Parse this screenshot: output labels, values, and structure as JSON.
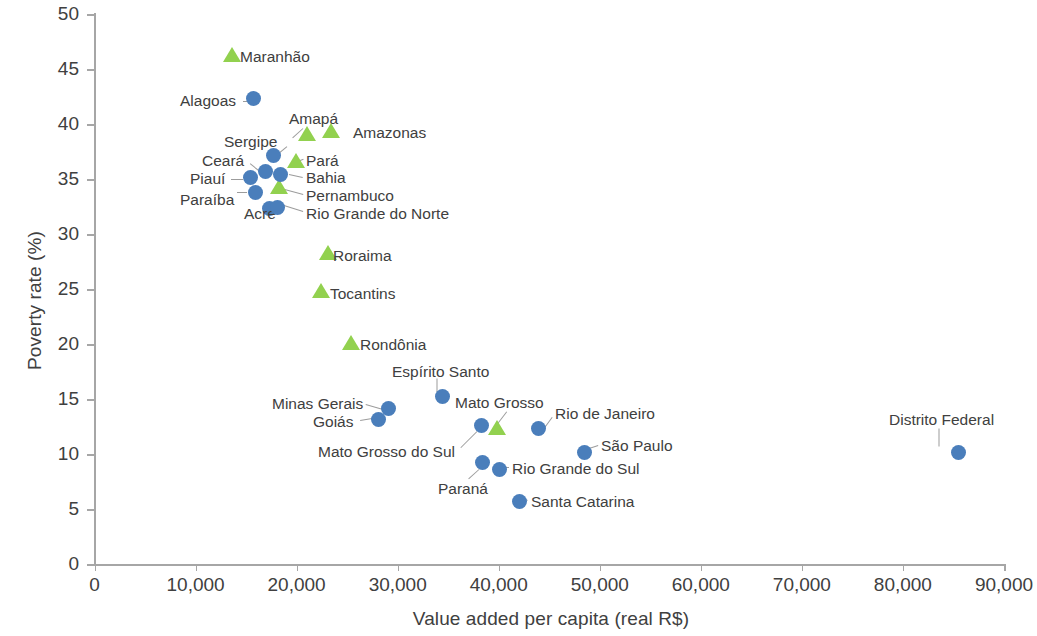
{
  "chart_data": {
    "type": "scatter",
    "title": "",
    "xlabel": "Value added per capita (real R$)",
    "ylabel": "Poverty rate (%)",
    "xlim": [
      0,
      90000
    ],
    "ylim": [
      0,
      50
    ],
    "xticks": [
      "0",
      "10,000",
      "20,000",
      "30,000",
      "40,000",
      "50,000",
      "60,000",
      "70,000",
      "80,000",
      "90,000"
    ],
    "xtick_values": [
      0,
      10000,
      20000,
      30000,
      40000,
      50000,
      60000,
      70000,
      80000,
      90000
    ],
    "yticks": [
      "0",
      "5",
      "10",
      "15",
      "20",
      "25",
      "30",
      "35",
      "40",
      "45",
      "50"
    ],
    "ytick_values": [
      0,
      5,
      10,
      15,
      20,
      25,
      30,
      35,
      40,
      45,
      50
    ],
    "grid": false,
    "legend": "none",
    "series": [
      {
        "name": "North/Northeast states",
        "marker": "triangle",
        "color": "#92d14f",
        "points": [
          {
            "label": "Maranhão",
            "x": 13600,
            "y": 46.3,
            "label_x": 240,
            "label_y": 48,
            "leader": null
          },
          {
            "label": "Amapá",
            "x": 21000,
            "y": 39.1,
            "label_x": 289,
            "label_y": 110,
            "leader": {
              "x1": 303,
              "y1": 128,
              "x2": 293,
              "y2": 137
            }
          },
          {
            "label": "Amazonas",
            "x": 23400,
            "y": 39.4,
            "label_x": 353,
            "label_y": 124,
            "leader": null
          },
          {
            "label": "Pará",
            "x": 19900,
            "y": 36.6,
            "label_x": 306,
            "label_y": 152,
            "leader": {
              "x1": 295,
              "y1": 162,
              "x2": 303,
              "y2": 159
            }
          },
          {
            "label": "Pernambuco",
            "x": 18300,
            "y": 34.3,
            "label_x": 306,
            "label_y": 187,
            "leader": {
              "x1": 281,
              "y1": 188,
              "x2": 303,
              "y2": 194
            }
          },
          {
            "label": "Roraima",
            "x": 23100,
            "y": 28.3,
            "label_x": 333,
            "label_y": 247,
            "leader": null
          },
          {
            "label": "Tocantins",
            "x": 22400,
            "y": 24.8,
            "label_x": 330,
            "label_y": 285,
            "leader": null
          },
          {
            "label": "Rondônia",
            "x": 25400,
            "y": 20.1,
            "label_x": 360,
            "label_y": 336,
            "leader": null
          },
          {
            "label": "Mato Grosso",
            "x": 39800,
            "y": 12.4,
            "label_x": 455,
            "label_y": 394,
            "leader": {
              "x1": 497,
              "y1": 424,
              "x2": 507,
              "y2": 411
            }
          }
        ]
      },
      {
        "name": "Other states",
        "marker": "circle",
        "color": "#4a7ebb",
        "points": [
          {
            "label": "Alagoas",
            "x": 15700,
            "y": 42.3,
            "label_x": 180,
            "label_y": 92,
            "leader": {
              "x1": 247,
              "y1": 101,
              "x2": 243,
              "y2": 101
            }
          },
          {
            "label": "Sergipe",
            "x": 17700,
            "y": 37.1,
            "label_x": 224,
            "label_y": 133,
            "leader": {
              "x1": 270,
              "y1": 160,
              "x2": 287,
              "y2": 146
            }
          },
          {
            "label": "Ceará",
            "x": 16900,
            "y": 35.7,
            "label_x": 202,
            "label_y": 152,
            "leader": {
              "x1": 261,
              "y1": 172,
              "x2": 250,
              "y2": 163
            }
          },
          {
            "label": "Piauí",
            "x": 15400,
            "y": 35.1,
            "label_x": 190,
            "label_y": 170,
            "leader": {
              "x1": 243,
              "y1": 179,
              "x2": 231,
              "y2": 179
            }
          },
          {
            "label": "Paraíba",
            "x": 15900,
            "y": 33.8,
            "label_x": 180,
            "label_y": 191,
            "leader": {
              "x1": 247,
              "y1": 192,
              "x2": 237,
              "y2": 192
            }
          },
          {
            "label": "Bahia",
            "x": 18400,
            "y": 35.4,
            "label_x": 306,
            "label_y": 169,
            "leader": {
              "x1": 289,
              "y1": 174,
              "x2": 303,
              "y2": 177
            }
          },
          {
            "label": "Acre",
            "x": 17300,
            "y": 32.3,
            "label_x": 244,
            "label_y": 205,
            "leader": {
              "x1": 270,
              "y1": 204,
              "x2": 281,
              "y2": 204
            }
          },
          {
            "label": "Rio Grande do Norte",
            "x": 18100,
            "y": 32.4,
            "label_x": 306,
            "label_y": 205,
            "leader": {
              "x1": 284,
              "y1": 205,
              "x2": 303,
              "y2": 211
            }
          },
          {
            "label": "Espírito Santo",
            "x": 34400,
            "y": 15.2,
            "label_x": 392,
            "label_y": 363,
            "leader": {
              "x1": 437,
              "y1": 392,
              "x2": 437,
              "y2": 378
            }
          },
          {
            "label": "Minas Gerais",
            "x": 29100,
            "y": 14.1,
            "label_x": 272,
            "label_y": 395,
            "leader": {
              "x1": 383,
              "y1": 409,
              "x2": 366,
              "y2": 404
            }
          },
          {
            "label": "Goiás",
            "x": 28100,
            "y": 13.1,
            "label_x": 313,
            "label_y": 413,
            "leader": {
              "x1": 372,
              "y1": 418,
              "x2": 360,
              "y2": 420
            }
          },
          {
            "label": "Mato Grosso do Sul",
            "x": 38300,
            "y": 12.6,
            "label_x": 318,
            "label_y": 443,
            "leader": {
              "x1": 477,
              "y1": 431,
              "x2": 461,
              "y2": 447
            }
          },
          {
            "label": "Rio de Janeiro",
            "x": 43900,
            "y": 12.3,
            "label_x": 555,
            "label_y": 405,
            "leader": {
              "x1": 544,
              "y1": 428,
              "x2": 552,
              "y2": 417
            }
          },
          {
            "label": "São Paulo",
            "x": 48500,
            "y": 10.1,
            "label_x": 601,
            "label_y": 437,
            "leader": {
              "x1": 583,
              "y1": 450,
              "x2": 598,
              "y2": 445
            }
          },
          {
            "label": "Paraná",
            "x": 38400,
            "y": 9.2,
            "label_x": 438,
            "label_y": 480,
            "leader": {
              "x1": 479,
              "y1": 469,
              "x2": 469,
              "y2": 478
            }
          },
          {
            "label": "Rio Grande do Sul",
            "x": 40100,
            "y": 8.6,
            "label_x": 512,
            "label_y": 460,
            "leader": {
              "x1": 504,
              "y1": 467,
              "x2": 509,
              "y2": 467
            }
          },
          {
            "label": "Santa Catarina",
            "x": 42100,
            "y": 5.7,
            "label_x": 531,
            "label_y": 493,
            "leader": {
              "x1": 522,
              "y1": 498,
              "x2": 528,
              "y2": 500
            }
          },
          {
            "label": "Distrito Federal",
            "x": 85500,
            "y": 10.1,
            "label_x": 889,
            "label_y": 411,
            "leader": {
              "x1": 939,
              "y1": 446,
              "x2": 939,
              "y2": 428
            }
          }
        ]
      }
    ]
  }
}
